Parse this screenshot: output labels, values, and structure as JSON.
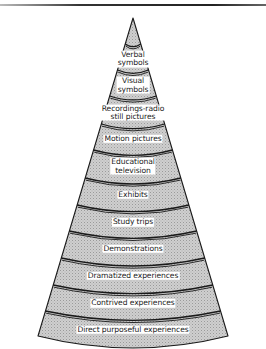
{
  "diagram": {
    "type": "cone-of-experience",
    "apex": {
      "x": 133,
      "y": 18
    },
    "base": {
      "left_x": 38,
      "right_x": 228,
      "y": 336
    },
    "colors": {
      "fill": "#c8c8c8",
      "stroke": "#1a1a1a",
      "label_bg": "#ffffff",
      "text": "#222222"
    },
    "bands": [
      {
        "label": "Verbal symbols",
        "lines": [
          "Verbal",
          "symbols"
        ],
        "y": 57
      },
      {
        "label": "Visual symbols",
        "lines": [
          "Visual",
          "symbols"
        ],
        "y": 83
      },
      {
        "label": "Recordings-radio still pictures",
        "lines": [
          "Recordings-radio",
          "still pictures"
        ],
        "y": 110
      },
      {
        "label": "Motion pictures",
        "lines": [
          "Motion pictures"
        ],
        "y": 136
      },
      {
        "label": "Educational television",
        "lines": [
          "Educational",
          "television"
        ],
        "y": 163
      },
      {
        "label": "Exhibits",
        "lines": [
          "Exhibits"
        ],
        "y": 191
      },
      {
        "label": "Study trips",
        "lines": [
          "Study trips"
        ],
        "y": 218
      },
      {
        "label": "Demonstrations",
        "lines": [
          "Demonstrations"
        ],
        "y": 244
      },
      {
        "label": "Dramatized experiences",
        "lines": [
          "Dramatized experiences"
        ],
        "y": 271
      },
      {
        "label": "Contrived experiences",
        "lines": [
          "Contrived experiences"
        ],
        "y": 298
      },
      {
        "label": "Direct purposeful experiences",
        "lines": [
          "Direct purposeful experiences"
        ],
        "y": 324
      }
    ],
    "dividers_y": [
      44,
      70,
      96,
      124,
      150,
      178,
      205,
      231,
      258,
      285,
      311
    ]
  }
}
